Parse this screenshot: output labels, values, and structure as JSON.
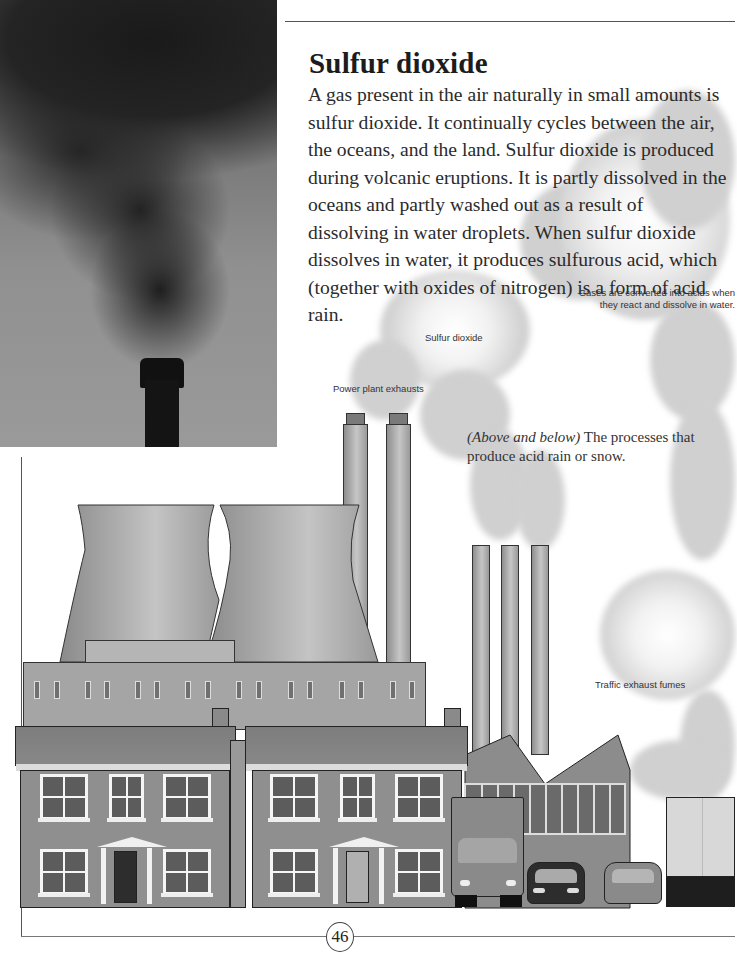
{
  "page": {
    "title": "Sulfur dioxide",
    "body": "A gas present in the air naturally in small amounts is sulfur dioxide. It continually cycles between the air, the oceans, and the land. Sulfur dioxide is produced during volcanic eruptions. It is partly dissolved in the oceans and partly washed out as a result of dissolving in water droplets. When sulfur dioxide dissolves in water, it produces sulfurous acid, which (together with oxides of nitrogen) is a form of acid rain.",
    "page_number": "46"
  },
  "illustration": {
    "labels": {
      "gases_converted": "Gases are converted into acids when they react and dissolve in water.",
      "sulfur_dioxide": "Sulfur dioxide",
      "power_plant_exhausts": "Power plant exhausts",
      "traffic_exhaust": "Traffic exhaust fumes"
    },
    "caption": {
      "italic": "(Above and below)",
      "text": " The processes that produce acid rain or snow."
    }
  },
  "photo": {
    "subject": "smokestack-emitting-black-smoke"
  },
  "colors": {
    "text": "#2b2b2b",
    "title": "#1c1c1c",
    "smoke": "#d0d0d0",
    "building": "#a5a5a5",
    "house": "#8f8f8f"
  }
}
